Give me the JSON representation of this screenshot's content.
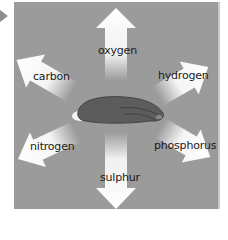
{
  "diagram": {
    "center_object": "decomposing-animal",
    "labels": {
      "top": "oxygen",
      "top_left": "carbon",
      "top_right": "hydrogen",
      "bottom_left": "nitrogen",
      "bottom_right": "phosphorus",
      "bottom": "sulphur"
    },
    "colors": {
      "panel": "#9b9b9b",
      "arrow": "#ffffff",
      "animal": "#5a5a5a",
      "pointer": "#8e8e8e"
    }
  }
}
